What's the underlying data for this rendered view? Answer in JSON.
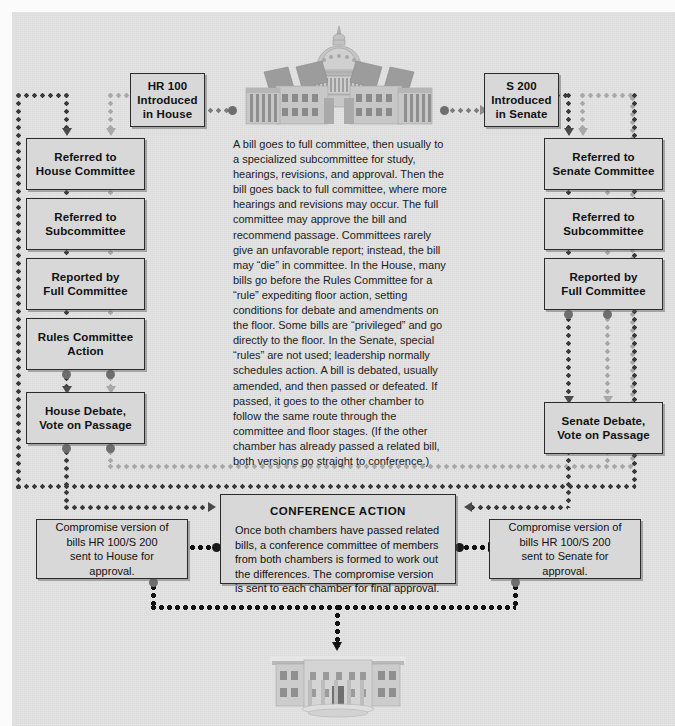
{
  "diagram": {
    "body_text": "A bill goes to full committee, then usually to a specialized subcommittee for study, hearings, revisions, and approval. Then the bill goes back to full committee, where more hearings and revisions may occur. The full committee may approve the bill and recommend passage. Committees rarely give an unfavorable report; instead, the bill may “die” in committee. In the House, many bills go before the Rules Committee for a “rule” expediting floor action, setting conditions for debate and amendments on the floor. Some bills are “privileged” and go directly to the floor. In the Senate, special “rules” are not used; leadership normally schedules action. A bill is debated, usually amended, and then passed or defeated. If passed, it goes to the other chamber to follow the same route through the committee and floor stages. (If the other chamber has already passed a related bill, both versions go straight to conference.)",
    "colors": {
      "background": "#e3e3e3",
      "box_fill": "#d8d8d8",
      "box_border": "#2b2b2b",
      "connector_dark": "#3a3a3a",
      "connector_light": "#a8a8a8",
      "connector_black": "#121212",
      "text": "#111111"
    }
  },
  "house_column": {
    "intro": {
      "line1": "HR 100",
      "line2": "Introduced",
      "line3": "in House"
    },
    "steps": [
      {
        "line1": "Referred to",
        "line2": "House Committee"
      },
      {
        "line1": "Referred to",
        "line2": "Subcommittee"
      },
      {
        "line1": "Reported by",
        "line2": "Full Committee"
      },
      {
        "line1": "Rules Committee",
        "line2": "Action"
      },
      {
        "line1": "House Debate,",
        "line2": "Vote on Passage"
      }
    ]
  },
  "senate_column": {
    "intro": {
      "line1": "S 200",
      "line2": "Introduced",
      "line3": "in Senate"
    },
    "steps": [
      {
        "line1": "Referred to",
        "line2": "Senate Committee"
      },
      {
        "line1": "Referred to",
        "line2": "Subcommittee"
      },
      {
        "line1": "Reported by",
        "line2": "Full Committee"
      },
      {
        "line1": "Senate Debate,",
        "line2": "Vote on Passage"
      }
    ]
  },
  "conference": {
    "title": "CONFERENCE ACTION",
    "body": "Once both chambers have passed related bills, a conference committee of members from both chambers is formed to work out the differences. The compromise version is sent to each chamber for final approval."
  },
  "compromise_house": {
    "line1": "Compromise version of",
    "line2": "bills HR 100/S 200",
    "line3": "sent to House for approval."
  },
  "compromise_senate": {
    "line1": "Compromise version of",
    "line2": "bills HR 100/S 200",
    "line3": "sent to Senate for approval."
  },
  "illustrations": {
    "capitol": "capitol-building",
    "white_house": "white-house-building"
  }
}
